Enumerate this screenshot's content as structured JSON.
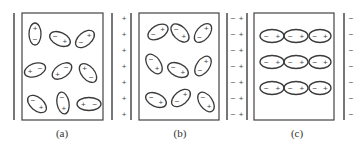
{
  "figure": {
    "panels": [
      {
        "id": "a",
        "caption": "(a)",
        "description": "Dielectric with randomly oriented dipoles, no external field",
        "plates": {
          "left_charge": "",
          "right_charge": ""
        },
        "dipoles": [
          {
            "cx": 35,
            "cy": 34,
            "rx": 6,
            "ry": 11,
            "angle": 0,
            "pos_end": "top"
          },
          {
            "cx": 60,
            "cy": 39,
            "rx": 11,
            "ry": 6.5,
            "angle": 25,
            "pos_end": "right"
          },
          {
            "cx": 85,
            "cy": 39,
            "rx": 11,
            "ry": 6.5,
            "angle": -40,
            "pos_end": "right"
          },
          {
            "cx": 35,
            "cy": 70,
            "rx": 11,
            "ry": 6.5,
            "angle": -20,
            "pos_end": "left"
          },
          {
            "cx": 62,
            "cy": 71,
            "rx": 11,
            "ry": 6.5,
            "angle": -35,
            "pos_end": "left"
          },
          {
            "cx": 88,
            "cy": 73,
            "rx": 11,
            "ry": 6.5,
            "angle": 50,
            "pos_end": "left"
          },
          {
            "cx": 37,
            "cy": 104,
            "rx": 11,
            "ry": 6.5,
            "angle": 40,
            "pos_end": "right"
          },
          {
            "cx": 63,
            "cy": 103,
            "rx": 6,
            "ry": 11,
            "angle": -10,
            "pos_end": "bottom"
          },
          {
            "cx": 89,
            "cy": 104,
            "rx": 12,
            "ry": 6.5,
            "angle": 0,
            "pos_end": "left"
          }
        ]
      },
      {
        "id": "b",
        "caption": "(b)",
        "description": "Dipoles partially aligned with external field",
        "plates": {
          "left_charge": "+",
          "right_charge": "−"
        },
        "dipoles": [
          {
            "cx": 158,
            "cy": 32,
            "rx": 11,
            "ry": 6.5,
            "angle": -30,
            "pos_end": "right"
          },
          {
            "cx": 180,
            "cy": 33,
            "rx": 11,
            "ry": 6.5,
            "angle": 45,
            "pos_end": "right"
          },
          {
            "cx": 203,
            "cy": 33,
            "rx": 11,
            "ry": 6.5,
            "angle": -50,
            "pos_end": "right"
          },
          {
            "cx": 154,
            "cy": 64,
            "rx": 11,
            "ry": 6.5,
            "angle": 55,
            "pos_end": "right"
          },
          {
            "cx": 178,
            "cy": 70,
            "rx": 11,
            "ry": 6.5,
            "angle": 25,
            "pos_end": "right"
          },
          {
            "cx": 203,
            "cy": 66,
            "rx": 11,
            "ry": 6.5,
            "angle": -55,
            "pos_end": "right"
          },
          {
            "cx": 156,
            "cy": 100,
            "rx": 11,
            "ry": 6.5,
            "angle": 25,
            "pos_end": "right"
          },
          {
            "cx": 181,
            "cy": 98,
            "rx": 11,
            "ry": 6.5,
            "angle": -40,
            "pos_end": "right"
          },
          {
            "cx": 206,
            "cy": 102,
            "rx": 11,
            "ry": 6.5,
            "angle": 55,
            "pos_end": "right"
          }
        ]
      },
      {
        "id": "c",
        "caption": "(c)",
        "description": "Dipoles fully aligned with external field",
        "plates": {
          "left_charge": "+",
          "right_charge": "−"
        },
        "dipoles": [
          {
            "cx": 272,
            "cy": 36,
            "rx": 12,
            "ry": 6.5,
            "angle": 0,
            "pos_end": "right"
          },
          {
            "cx": 296,
            "cy": 36,
            "rx": 12,
            "ry": 6.5,
            "angle": 0,
            "pos_end": "right"
          },
          {
            "cx": 320,
            "cy": 36,
            "rx": 11,
            "ry": 6.5,
            "angle": 0,
            "pos_end": "right"
          },
          {
            "cx": 272,
            "cy": 62,
            "rx": 12,
            "ry": 6.5,
            "angle": 0,
            "pos_end": "right"
          },
          {
            "cx": 296,
            "cy": 62,
            "rx": 12,
            "ry": 6.5,
            "angle": 0,
            "pos_end": "right"
          },
          {
            "cx": 320,
            "cy": 62,
            "rx": 11,
            "ry": 6.5,
            "angle": 0,
            "pos_end": "right"
          },
          {
            "cx": 272,
            "cy": 88,
            "rx": 12,
            "ry": 6.5,
            "angle": 0,
            "pos_end": "right"
          },
          {
            "cx": 296,
            "cy": 88,
            "rx": 12,
            "ry": 6.5,
            "angle": 0,
            "pos_end": "right"
          },
          {
            "cx": 320,
            "cy": 88,
            "rx": 11,
            "ry": 6.5,
            "angle": 0,
            "pos_end": "right"
          }
        ]
      }
    ],
    "plate_charge_rows": [
      18,
      34,
      50,
      66,
      82,
      98,
      114
    ],
    "symbols": {
      "plus": "+",
      "minus": "−"
    },
    "colors": {
      "stroke": "#3a3a3a",
      "plate": "#555555",
      "text": "#444444"
    }
  }
}
